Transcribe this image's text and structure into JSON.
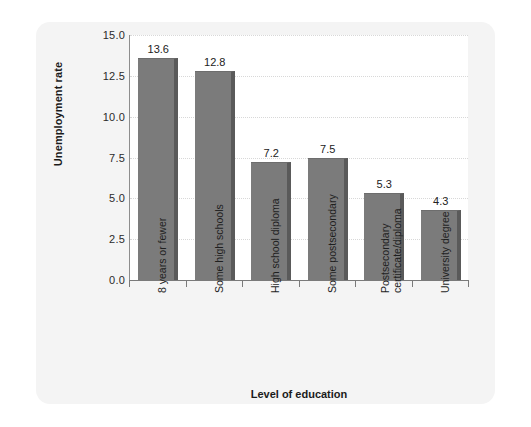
{
  "chart_data": {
    "type": "bar",
    "title": "",
    "subtitle": "",
    "xlabel": "Level of education",
    "ylabel": "Unemployment rate",
    "categories": [
      "8 years or fewer",
      "Some high schools",
      "High school diploma",
      "Some postsecondary",
      "Postsecondary certificate/diploma",
      "University degree"
    ],
    "category_lines": [
      [
        "8 years or fewer"
      ],
      [
        "Some high schools"
      ],
      [
        "High school diploma"
      ],
      [
        "Some postsecondary"
      ],
      [
        "Postsecondary",
        "certificate/diploma"
      ],
      [
        "University degree"
      ]
    ],
    "values": [
      13.6,
      12.8,
      7.2,
      7.5,
      5.3,
      4.3
    ],
    "value_labels": [
      "13.6",
      "12.8",
      "7.2",
      "7.5",
      "5.3",
      "4.3"
    ],
    "ylim": [
      0.0,
      15.0
    ],
    "yticks": [
      0.0,
      2.5,
      5.0,
      7.5,
      10.0,
      12.5,
      15.0
    ],
    "ytick_labels": [
      "0.0",
      "2.5",
      "5.0",
      "7.5",
      "10.0",
      "12.5",
      "15.0"
    ],
    "grid": true,
    "grid_axis": "y",
    "legend": false,
    "legend_position": "none",
    "bar_color": "#7b7b7b",
    "bar_shadow_color": "#5a5a5a",
    "panel_color": "#ffffff",
    "page_color": "#f4f4f4",
    "grid_color": "#d8d8d8",
    "axis_color": "#7a7a7a",
    "text_color": "#1f1f1f"
  }
}
